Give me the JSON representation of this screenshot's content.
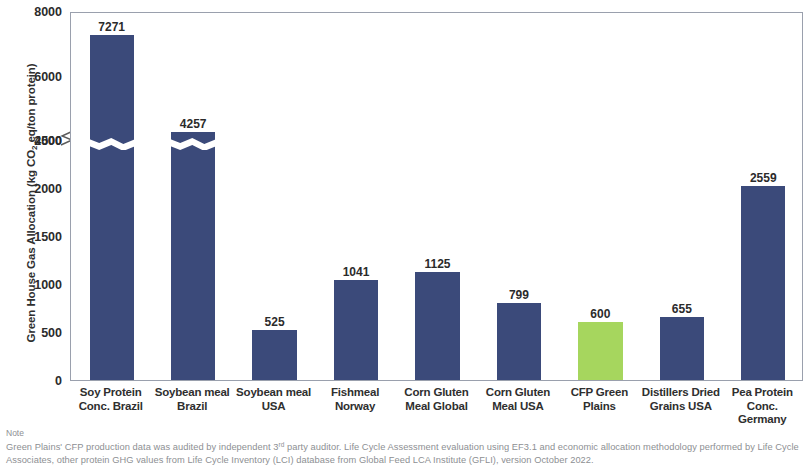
{
  "chart_data": {
    "type": "bar",
    "title": "",
    "xlabel": "",
    "ylabel": "Green House Gas Allocation (kg CO2 eq/ton protein)",
    "ylabel_parts": {
      "pre": "Green House Gas Allocation (kg CO",
      "sub": "2",
      "post": " eq/ton protein)"
    },
    "categories": [
      "Soy Protein Conc. Brazil",
      "Soybean meal Brazil",
      "Soybean meal USA",
      "Fishmeal Norway",
      "Corn Gluten Meal Global",
      "Corn Gluten Meal USA",
      "CFP Green Plains",
      "Distillers Dried Grains USA",
      "Pea Protein Conc. Germany"
    ],
    "category_lines": [
      [
        "Soy Protein",
        "Conc. Brazil"
      ],
      [
        "Soybean meal",
        "Brazil"
      ],
      [
        "Soybean meal",
        "USA"
      ],
      [
        "Fishmeal",
        "Norway"
      ],
      [
        "Corn Gluten",
        "Meal Global"
      ],
      [
        "Corn Gluten",
        "Meal USA"
      ],
      [
        "CFP Green",
        "Plains"
      ],
      [
        "Distillers Dried",
        "Grains USA"
      ],
      [
        "Pea Protein",
        "Conc.",
        "Germany"
      ]
    ],
    "values": [
      7271,
      4257,
      525,
      1041,
      1125,
      799,
      600,
      655,
      2559
    ],
    "value_labels": [
      "7271",
      "4257",
      "525",
      "1041",
      "1125",
      "799",
      "600",
      "655",
      "2559"
    ],
    "highlight_index": 6,
    "bar_color": "#3b4a7a",
    "highlight_color": "#a6d65e",
    "ytick_labels": [
      "0",
      "500",
      "1000",
      "1500",
      "2000",
      "2500",
      "4000",
      "6000",
      "8000"
    ],
    "ytick_values": [
      0,
      500,
      1000,
      1500,
      2000,
      2500,
      4000,
      6000,
      8000
    ],
    "ylim": [
      0,
      8000
    ],
    "axis_break": {
      "from": 2500,
      "to": 4000,
      "present": true
    },
    "grid": false,
    "legend": null
  },
  "note": {
    "title": "Note",
    "line1_pre": "Green Plains' CFP production data was audited by independent 3",
    "line1_sup": "rd",
    "line1_post": " party auditor. Life Cycle Assessment evaluation using EF3.1 and economic allocation methodology",
    "line2": "performed by Life Cycle Associates, other protein GHG values from Life Cycle Inventory (LCI) database from Global Feed LCA Institute (GFLI), version October 2022."
  }
}
